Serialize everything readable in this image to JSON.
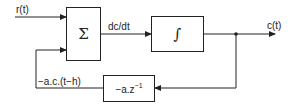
{
  "diagram": {
    "inputs": {
      "r": "r(t)"
    },
    "blocks": {
      "sum": {
        "symbol": "Σ"
      },
      "integrator": {
        "symbol": "∫"
      },
      "delay": {
        "label": "−a.z",
        "exponent": "−1"
      }
    },
    "signals": {
      "derivative": "dc/dt",
      "output": "c(t)",
      "feedback": "−a.c.(t−h)"
    }
  }
}
